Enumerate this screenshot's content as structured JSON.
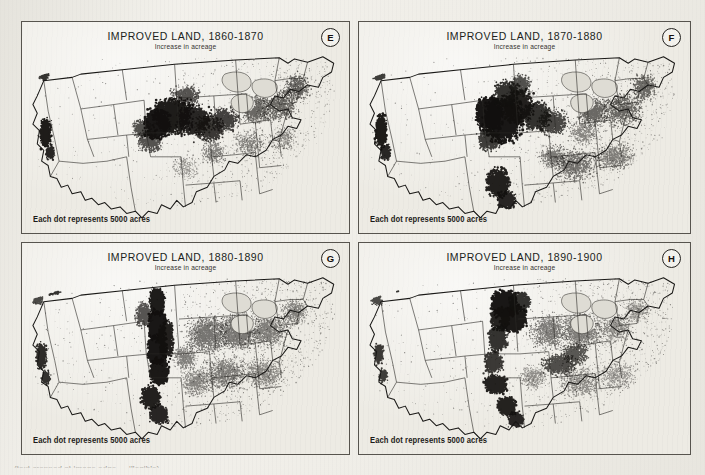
{
  "figure": {
    "subtitle_common": "Increase in acreage",
    "caption_common": "Each dot represents 5000 acres",
    "dot_value_acres": 5000,
    "ink_color": "#12100e",
    "paper_color": "#edebe4",
    "border_color": "#57544e",
    "bottom_caption_partial": "(text cropped at image edge — illegible)"
  },
  "panels": [
    {
      "id": "E",
      "letter": "E",
      "title": "IMPROVED LAND, 1860-1870",
      "subtitle": "Increase in acreage",
      "caption": "Each dot represents 5000 acres",
      "decade_start": 1860,
      "decade_end": 1870
    },
    {
      "id": "F",
      "letter": "F",
      "title": "IMPROVED LAND, 1870-1880",
      "subtitle": "Increase in acreage",
      "caption": "Each dot represents 5000 acres",
      "decade_start": 1870,
      "decade_end": 1880
    },
    {
      "id": "G",
      "letter": "G",
      "title": "IMPROVED LAND, 1880-1890",
      "subtitle": "Increase in acreage",
      "caption": "Each dot represents 5000 acres",
      "decade_start": 1880,
      "decade_end": 1890
    },
    {
      "id": "H",
      "letter": "H",
      "title": "IMPROVED LAND, 1890-1900",
      "subtitle": "Increase in acreage",
      "caption": "Each dot represents 5000 acres",
      "decade_start": 1890,
      "decade_end": 1900
    }
  ],
  "chart_data": {
    "type": "scatter",
    "subtitle": "Increase in acreage",
    "xlabel": "",
    "ylabel": "",
    "grid": false,
    "legend": "none",
    "annotations": [
      "Each dot represents 5000 acres",
      "Panel letters E, F, G, H in upper-right circles"
    ],
    "note": "Four small-multiple dot-density maps of the contiguous United States; each dot = 5000 acres of newly improved farmland during the stated decade.",
    "series": [
      {
        "name": "1860-1870 (Panel E)",
        "clusters": [
          {
            "region": "Iowa / northern Illinois / northern Missouri",
            "density": "very high",
            "cx": 0.47,
            "cy": 0.42,
            "rx": 0.11,
            "ry": 0.13
          },
          {
            "region": "Illinois / Indiana / Ohio corn belt",
            "density": "high",
            "cx": 0.57,
            "cy": 0.46,
            "rx": 0.09,
            "ry": 0.1
          },
          {
            "region": "Wisconsin / southern Minnesota",
            "density": "moderate",
            "cx": 0.5,
            "cy": 0.28,
            "rx": 0.06,
            "ry": 0.07
          },
          {
            "region": "California Central Valley",
            "density": "high",
            "cx": 0.075,
            "cy": 0.46,
            "rx": 0.028,
            "ry": 0.1
          },
          {
            "region": "Willamette Valley, Oregon",
            "density": "low",
            "cx": 0.075,
            "cy": 0.13,
            "rx": 0.025,
            "ry": 0.05
          },
          {
            "region": "Middle Atlantic / New England",
            "density": "low-moderate",
            "cx": 0.8,
            "cy": 0.32,
            "rx": 0.1,
            "ry": 0.1
          },
          {
            "region": "Kansas / eastern Nebraska",
            "density": "moderate",
            "cx": 0.4,
            "cy": 0.5,
            "rx": 0.05,
            "ry": 0.06
          }
        ]
      },
      {
        "name": "1870-1880 (Panel F)",
        "clusters": [
          {
            "region": "Iowa / Nebraska / Kansas plains front",
            "density": "very high",
            "cx": 0.44,
            "cy": 0.44,
            "rx": 0.12,
            "ry": 0.16
          },
          {
            "region": "Minnesota / Dakota prairie edge",
            "density": "high",
            "cx": 0.46,
            "cy": 0.26,
            "rx": 0.07,
            "ry": 0.09
          },
          {
            "region": "Illinois / Indiana",
            "density": "high",
            "cx": 0.56,
            "cy": 0.44,
            "rx": 0.07,
            "ry": 0.09
          },
          {
            "region": "Central Texas",
            "density": "high",
            "cx": 0.42,
            "cy": 0.75,
            "rx": 0.05,
            "ry": 0.09
          },
          {
            "region": "California Central Valley",
            "density": "high",
            "cx": 0.065,
            "cy": 0.45,
            "rx": 0.03,
            "ry": 0.11
          },
          {
            "region": "Southeast cotton belt",
            "density": "moderate",
            "cx": 0.66,
            "cy": 0.66,
            "rx": 0.12,
            "ry": 0.09
          }
        ]
      },
      {
        "name": "1880-1890 (Panel G)",
        "clusters": [
          {
            "region": "Great Plains band: Dakotas–Nebraska–Kansas",
            "density": "very high",
            "cx": 0.42,
            "cy": 0.42,
            "rx": 0.055,
            "ry": 0.3
          },
          {
            "region": "Central Texas",
            "density": "high",
            "cx": 0.4,
            "cy": 0.76,
            "rx": 0.05,
            "ry": 0.09
          },
          {
            "region": "Eastern states general fill",
            "density": "low-moderate",
            "cx": 0.7,
            "cy": 0.5,
            "rx": 0.2,
            "ry": 0.22
          },
          {
            "region": "California Central Valley",
            "density": "moderate",
            "cx": 0.06,
            "cy": 0.5,
            "rx": 0.025,
            "ry": 0.1
          },
          {
            "region": "Eastern Washington / Palouse",
            "density": "moderate",
            "cx": 0.11,
            "cy": 0.12,
            "rx": 0.05,
            "ry": 0.05
          }
        ]
      },
      {
        "name": "1890-1900 (Panel H)",
        "clusters": [
          {
            "region": "Dakotas / Minnesota spring-wheat belt",
            "density": "very high",
            "cx": 0.45,
            "cy": 0.26,
            "rx": 0.08,
            "ry": 0.13
          },
          {
            "region": "Oklahoma Territory",
            "density": "high",
            "cx": 0.42,
            "cy": 0.6,
            "rx": 0.05,
            "ry": 0.06
          },
          {
            "region": "Texas blackland prairie",
            "density": "high",
            "cx": 0.44,
            "cy": 0.73,
            "rx": 0.05,
            "ry": 0.08
          },
          {
            "region": "Kansas / Nebraska",
            "density": "moderate-high",
            "cx": 0.43,
            "cy": 0.46,
            "rx": 0.06,
            "ry": 0.09
          },
          {
            "region": "Kentucky / Tennessee / mid-South",
            "density": "moderate",
            "cx": 0.63,
            "cy": 0.55,
            "rx": 0.09,
            "ry": 0.08
          },
          {
            "region": "Eastern Washington / Palouse",
            "density": "moderate",
            "cx": 0.12,
            "cy": 0.11,
            "rx": 0.05,
            "ry": 0.05
          }
        ]
      }
    ]
  }
}
